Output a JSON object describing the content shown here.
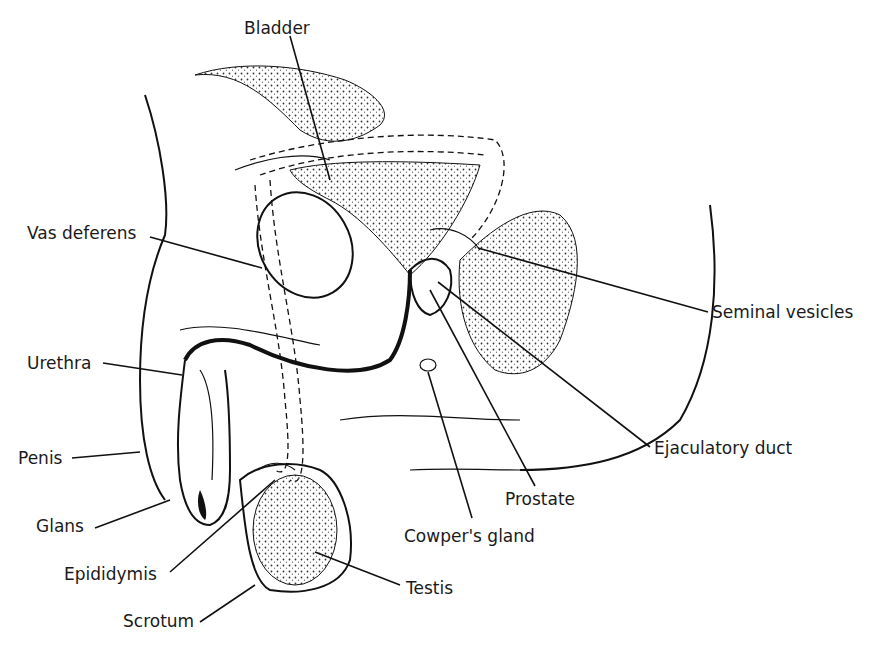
{
  "diagram": {
    "type": "anatomical-line-drawing",
    "labels": [
      {
        "id": "bladder",
        "text": "Bladder",
        "x": 244,
        "y": 20
      },
      {
        "id": "vas-deferens",
        "text": "Vas deferens",
        "x": 27,
        "y": 225
      },
      {
        "id": "urethra",
        "text": "Urethra",
        "x": 27,
        "y": 355
      },
      {
        "id": "penis",
        "text": "Penis",
        "x": 18,
        "y": 450
      },
      {
        "id": "glans",
        "text": "Glans",
        "x": 36,
        "y": 518
      },
      {
        "id": "epididymis",
        "text": "Epididymis",
        "x": 64,
        "y": 566
      },
      {
        "id": "scrotum",
        "text": "Scrotum",
        "x": 123,
        "y": 613
      },
      {
        "id": "testis",
        "text": "Testis",
        "x": 406,
        "y": 580
      },
      {
        "id": "cowpers-gland",
        "text": "Cowper's gland",
        "x": 404,
        "y": 528
      },
      {
        "id": "prostate",
        "text": "Prostate",
        "x": 505,
        "y": 491
      },
      {
        "id": "ejaculatory-duct",
        "text": "Ejaculatory duct",
        "x": 654,
        "y": 440
      },
      {
        "id": "seminal-vesicles",
        "text": "Seminal vesicles",
        "x": 712,
        "y": 304
      }
    ]
  }
}
